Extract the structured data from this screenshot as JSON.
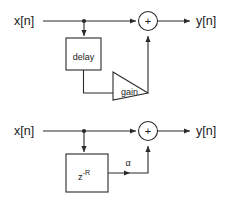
{
  "figure": {
    "type": "block-diagram",
    "title": "",
    "background_color": "#ffffff",
    "line_color": "#2b2b2b",
    "text_color": "#1a1a1a",
    "diagrams": [
      {
        "id": "upper",
        "description": "Feedforward comb filter drawn with generic blocks",
        "input_label": "x[n]",
        "output_label": "y[n]",
        "blocks": [
          {
            "name": "delay-block",
            "shape": "rectangle",
            "label": "delay"
          },
          {
            "name": "gain-block",
            "shape": "triangle",
            "label": "gain"
          },
          {
            "name": "summing-junction",
            "shape": "circle",
            "label": "+"
          }
        ],
        "nodes": [
          {
            "name": "input-tap",
            "shape": "dot"
          }
        ]
      },
      {
        "id": "lower",
        "description": "Same filter drawn with z-transform notation",
        "input_label": "x[n]",
        "output_label": "y[n]",
        "blocks": [
          {
            "name": "delay-block",
            "shape": "rectangle",
            "label_main": "z",
            "label_superscript": "-R"
          },
          {
            "name": "gain-label",
            "shape": "text",
            "label": "α"
          },
          {
            "name": "summing-junction",
            "shape": "circle",
            "label": "+"
          }
        ],
        "nodes": [
          {
            "name": "input-tap",
            "shape": "dot"
          }
        ]
      }
    ]
  }
}
